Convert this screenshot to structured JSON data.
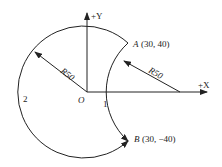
{
  "diagram": {
    "axes": {
      "x_label": "+X",
      "y_label": "+Y",
      "origin_label": "O"
    },
    "points": {
      "A": {
        "name": "A",
        "coords": "(30, 40)"
      },
      "B": {
        "name": "B",
        "coords": "(30, −40)"
      }
    },
    "radii": {
      "big_arc": "R50",
      "small_arc": "R50"
    },
    "path_labels": {
      "path1": "1",
      "path2": "2"
    },
    "colors": {
      "line": "#222222",
      "background": "#ffffff"
    }
  }
}
